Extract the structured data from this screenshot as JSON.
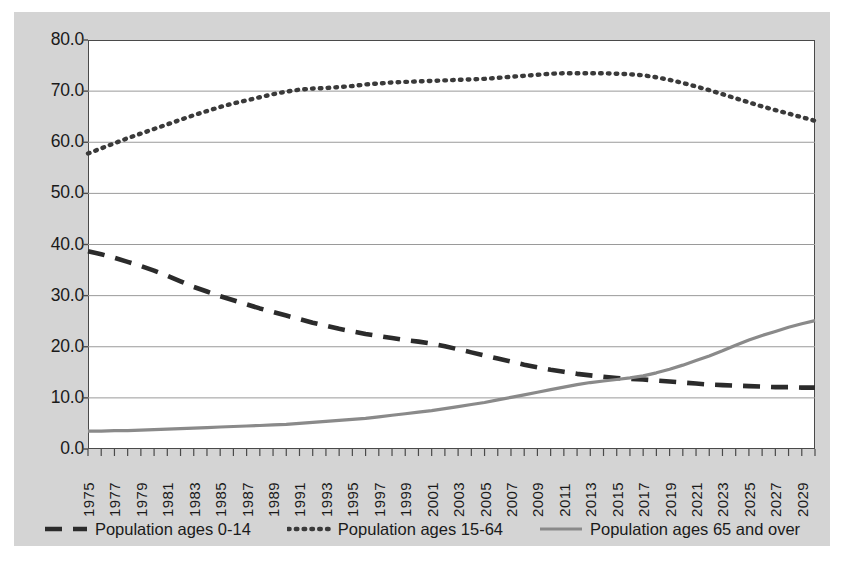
{
  "chart_data": {
    "type": "line",
    "title": "",
    "xlabel": "",
    "ylabel": "",
    "xlim": [
      1975,
      2030
    ],
    "ylim": [
      0.0,
      80.0
    ],
    "y_ticks": [
      "0.0",
      "10.0",
      "20.0",
      "30.0",
      "40.0",
      "50.0",
      "60.0",
      "70.0",
      "80.0"
    ],
    "y_tick_values": [
      0,
      10,
      20,
      30,
      40,
      50,
      60,
      70,
      80
    ],
    "grid": "horizontal",
    "legend_position": "bottom",
    "x": [
      1975,
      1976,
      1977,
      1978,
      1979,
      1980,
      1981,
      1982,
      1983,
      1984,
      1985,
      1986,
      1987,
      1988,
      1989,
      1990,
      1991,
      1992,
      1993,
      1994,
      1995,
      1996,
      1997,
      1998,
      1999,
      2000,
      2001,
      2002,
      2003,
      2004,
      2005,
      2006,
      2007,
      2008,
      2009,
      2010,
      2011,
      2012,
      2013,
      2014,
      2015,
      2016,
      2017,
      2018,
      2019,
      2020,
      2021,
      2022,
      2023,
      2024,
      2025,
      2026,
      2027,
      2028,
      2029,
      2030
    ],
    "x_tick_labels": [
      "1975",
      "1977",
      "1979",
      "1981",
      "1983",
      "1985",
      "1987",
      "1989",
      "1991",
      "1993",
      "1995",
      "1997",
      "1999",
      "2001",
      "2003",
      "2005",
      "2007",
      "2009",
      "2011",
      "2013",
      "2015",
      "2017",
      "2019",
      "2021",
      "2023",
      "2025",
      "2027",
      "2029"
    ],
    "series": [
      {
        "name": "Population ages 0-14",
        "style": "dashed",
        "color": "#2b2b2b",
        "values": [
          38.7,
          38.1,
          37.4,
          36.6,
          35.8,
          34.9,
          33.9,
          32.8,
          31.7,
          30.8,
          29.9,
          29.1,
          28.3,
          27.5,
          26.8,
          26.1,
          25.4,
          24.7,
          24.1,
          23.5,
          23.0,
          22.5,
          22.1,
          21.7,
          21.3,
          21.0,
          20.6,
          20.1,
          19.5,
          18.9,
          18.3,
          17.7,
          17.1,
          16.5,
          16.0,
          15.5,
          15.1,
          14.7,
          14.4,
          14.1,
          13.9,
          13.7,
          13.6,
          13.4,
          13.2,
          13.0,
          12.8,
          12.6,
          12.5,
          12.4,
          12.3,
          12.2,
          12.1,
          12.1,
          12.0,
          12.0
        ]
      },
      {
        "name": "Population ages 15-64",
        "style": "dotted",
        "color": "#3a3a3a",
        "values": [
          57.8,
          58.8,
          59.8,
          60.8,
          61.7,
          62.6,
          63.5,
          64.4,
          65.3,
          66.1,
          66.9,
          67.6,
          68.2,
          68.8,
          69.4,
          69.9,
          70.3,
          70.5,
          70.6,
          70.8,
          71.0,
          71.3,
          71.5,
          71.7,
          71.8,
          71.9,
          72.0,
          72.1,
          72.2,
          72.3,
          72.4,
          72.6,
          72.8,
          73.0,
          73.2,
          73.4,
          73.5,
          73.5,
          73.5,
          73.5,
          73.4,
          73.3,
          73.1,
          72.7,
          72.2,
          71.6,
          70.9,
          70.2,
          69.4,
          68.6,
          67.8,
          67.0,
          66.3,
          65.6,
          64.9,
          64.2
        ]
      },
      {
        "name": "Population ages 65 and over",
        "style": "solid",
        "color": "#8a8a8a",
        "values": [
          3.5,
          3.5,
          3.6,
          3.6,
          3.7,
          3.8,
          3.9,
          4.0,
          4.1,
          4.2,
          4.3,
          4.4,
          4.5,
          4.6,
          4.7,
          4.8,
          5.0,
          5.2,
          5.4,
          5.6,
          5.8,
          6.0,
          6.3,
          6.6,
          6.9,
          7.2,
          7.5,
          7.9,
          8.3,
          8.7,
          9.1,
          9.6,
          10.1,
          10.6,
          11.1,
          11.6,
          12.1,
          12.6,
          13.0,
          13.3,
          13.6,
          13.9,
          14.3,
          14.9,
          15.6,
          16.4,
          17.3,
          18.2,
          19.2,
          20.3,
          21.3,
          22.2,
          23.0,
          23.8,
          24.5,
          25.1
        ]
      }
    ]
  },
  "legend": {
    "items": [
      {
        "label": "Population ages 0-14",
        "style": "dashed",
        "color": "#2b2b2b"
      },
      {
        "label": "Population ages 15-64",
        "style": "dotted",
        "color": "#3a3a3a"
      },
      {
        "label": "Population ages 65 and over",
        "style": "solid",
        "color": "#8a8a8a"
      }
    ]
  },
  "colors": {
    "background": "#d4d4d4",
    "plot_background": "#ffffff",
    "axis": "#4a4a4a",
    "gridline": "#9a9a9a",
    "text": "#1a1a1a"
  }
}
